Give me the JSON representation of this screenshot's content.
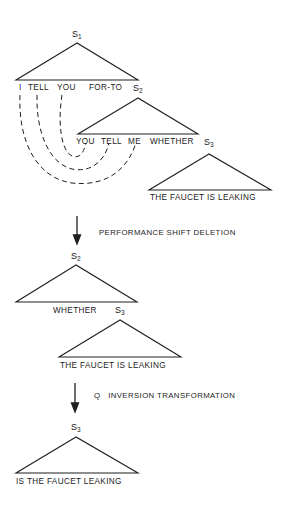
{
  "diagram": {
    "colors": {
      "line": "#1e1e1e",
      "text": "#1a1a1a",
      "background": "#ffffff"
    },
    "stage1": {
      "s1": {
        "label": "S",
        "sub": "1",
        "terminals": [
          "I",
          "TELL",
          "YOU",
          "FOR-TO"
        ]
      },
      "s2": {
        "label": "S",
        "sub": "2",
        "terminals": [
          "YOU",
          "TELL",
          "ME",
          "WHETHER"
        ]
      },
      "s3": {
        "label": "S",
        "sub": "3",
        "terminals": "THE FAUCET IS LEAKING"
      },
      "links": [
        {
          "from": "I",
          "to": "ME"
        },
        {
          "from": "TELL",
          "to": "TELL"
        },
        {
          "from": "YOU",
          "to": "YOU"
        }
      ]
    },
    "transform1": {
      "label": "PERFORMANCE SHIFT DELETION"
    },
    "stage2": {
      "s2": {
        "label": "S",
        "sub": "2",
        "terminals": "WHETHER"
      },
      "s3": {
        "label": "S",
        "sub": "3",
        "terminals": "THE FAUCET IS LEAKING"
      }
    },
    "transform2": {
      "label": "Q   INVERSION TRANSFORMATION"
    },
    "stage3": {
      "s3": {
        "label": "S",
        "sub": "3",
        "terminals": "IS THE FAUCET LEAKING"
      }
    }
  }
}
